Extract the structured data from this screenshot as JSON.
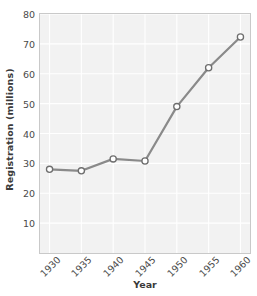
{
  "chart_data": {
    "type": "line",
    "title": "",
    "xlabel": "Year",
    "ylabel": "Registration (millions)",
    "x": [
      1930,
      1935,
      1940,
      1945,
      1950,
      1955,
      1960
    ],
    "categories": [
      "1930",
      "1935",
      "1940",
      "1945",
      "1950",
      "1955",
      "1960"
    ],
    "values": [
      28,
      27.5,
      31.5,
      30.8,
      49,
      62,
      72.3
    ],
    "series": [
      {
        "name": "Registration",
        "values": [
          28,
          27.5,
          31.5,
          30.8,
          49,
          62,
          72.3
        ]
      }
    ],
    "xlim": [
      1928.5,
      1961.5
    ],
    "ylim": [
      0,
      80
    ],
    "xticks": [
      "1930",
      "1935",
      "1940",
      "1945",
      "1950",
      "1955",
      "1960"
    ],
    "yticks": [
      "10",
      "20",
      "30",
      "40",
      "50",
      "60",
      "70",
      "80"
    ],
    "ytick_values": [
      10,
      20,
      30,
      40,
      50,
      60,
      70,
      80
    ],
    "grid": true,
    "legend": "none",
    "marker": "circle-open",
    "colors": {
      "line": "#8a8a8a",
      "marker_fill": "#ffffff",
      "marker_edge": "#6e6e6e",
      "panel_background": "#f2f2f2",
      "gridline": "#ffffff",
      "panel_border": "#c9c9c9",
      "text": "#4a4a4a"
    }
  }
}
